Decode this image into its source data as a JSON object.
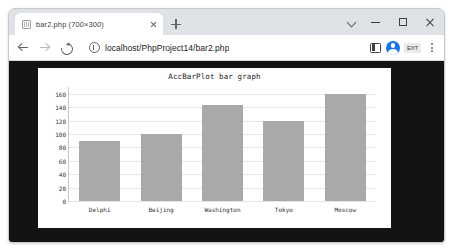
{
  "browser": {
    "tab": {
      "title": "bar2.php (700×300)",
      "favicon_name": "page-favicon",
      "close_label": "×"
    },
    "new_tab_label": "+",
    "window_controls": {
      "tab_search": "⌄",
      "minimize": "–",
      "maximize": "□",
      "close": "×"
    },
    "toolbar": {
      "back": "←",
      "forward": "→",
      "reload": "⟳",
      "site_info": "ⓘ",
      "url": "localhost/PhpProject14/bar2.php",
      "url_placeholder": "Search Google or type a URL",
      "side_panel": "side-panel",
      "extensions_badge": "EXT",
      "menu": "⋮"
    },
    "colors": {
      "tabstrip_bg": "#dee1e6",
      "toolbar_bg": "#ffffff",
      "avatar": "#1a73e8",
      "viewport_bg": "#131313"
    }
  },
  "chart_data": {
    "type": "bar",
    "title": "AccBarPlot bar graph",
    "xlabel": "",
    "ylabel": "",
    "categories": [
      "Delphi",
      "Beijing",
      "Washington",
      "Tokyo",
      "Moscow"
    ],
    "values": [
      90,
      100,
      143,
      120,
      160
    ],
    "ylim": [
      0,
      170
    ],
    "yticks": [
      0,
      20,
      40,
      60,
      80,
      100,
      120,
      140,
      160
    ],
    "grid": true,
    "legend": "none",
    "bar_color": "#a9a9a9",
    "plot_bg": "#ffffff",
    "canvas_size": "700×300"
  }
}
